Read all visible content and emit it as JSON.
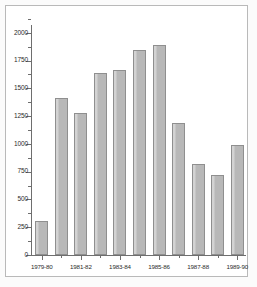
{
  "chart_data": {
    "type": "bar",
    "title": "",
    "subtitle": "",
    "xlabel": "",
    "ylabel": "",
    "categories": [
      "1979-80",
      "1980-81",
      "1981-82",
      "1982-83",
      "1983-84",
      "1984-85",
      "1985-86",
      "1986-87",
      "1987-88",
      "1988-89",
      "1989-90"
    ],
    "values": [
      310,
      1415,
      1275,
      1640,
      1665,
      1845,
      1890,
      1185,
      815,
      720,
      990
    ],
    "visible_x_tick_labels": [
      "1979-80",
      "1981-82",
      "1983-84",
      "1985-86",
      "1987-88",
      "1989-90"
    ],
    "visible_x_tick_indices": [
      0,
      2,
      4,
      6,
      8,
      10
    ],
    "y_tick_labels": [
      "0",
      "250",
      "500",
      "750",
      "1000",
      "1250",
      "1500",
      "1750",
      "2000"
    ],
    "y_tick_values": [
      0,
      250,
      500,
      750,
      1000,
      1250,
      1500,
      1750,
      2000
    ],
    "ylim": [
      0,
      2070
    ],
    "grid": false,
    "legend": null,
    "bar_fill_color": "#b8b8b8",
    "bar_border_color": "#8f8f8f",
    "axis_color": "#6e6e6e",
    "background_color": "#ffffff",
    "frame_color": "#b9b9b9"
  }
}
